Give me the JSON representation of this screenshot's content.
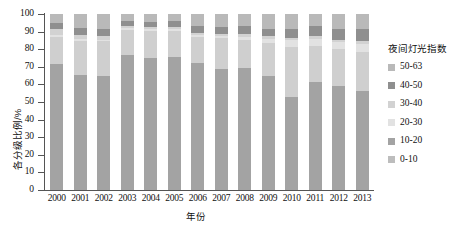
{
  "chart_data": {
    "type": "bar",
    "subtype": "stacked-percentage-bar",
    "title": "",
    "xlabel": "年份",
    "ylabel": "各分级比例/%",
    "ylim": [
      0,
      100
    ],
    "yticks": [
      0,
      10,
      20,
      30,
      40,
      50,
      60,
      70,
      80,
      90,
      100
    ],
    "grid": false,
    "legend_title": "夜间灯光指数",
    "legend_position": "right",
    "categories": [
      "2000",
      "2001",
      "2002",
      "2003",
      "2004",
      "2005",
      "2006",
      "2007",
      "2008",
      "2009",
      "2010",
      "2011",
      "2012",
      "2013"
    ],
    "series": [
      {
        "name": "0-10",
        "color": "#a3a3a3",
        "values": [
          71.5,
          65.5,
          64.5,
          76.5,
          75.0,
          75.5,
          72.0,
          69.0,
          69.5,
          65.0,
          53.0,
          61.5,
          59.0,
          56.0
        ]
      },
      {
        "name": "10-20",
        "color": "#cfcfcf",
        "values": [
          15.5,
          19.0,
          20.0,
          14.5,
          15.5,
          15.0,
          15.0,
          17.5,
          15.5,
          18.5,
          28.0,
          20.5,
          21.0,
          22.5
        ]
      },
      {
        "name": "20-30",
        "color": "#e2e2e2",
        "values": [
          1.0,
          1.5,
          1.0,
          1.0,
          1.0,
          1.0,
          1.0,
          1.0,
          2.0,
          2.5,
          4.0,
          4.0,
          4.0,
          4.5
        ]
      },
      {
        "name": "30-40",
        "color": "#d2d2d2",
        "values": [
          3.5,
          2.0,
          2.0,
          1.0,
          1.0,
          1.0,
          1.0,
          1.0,
          1.5,
          1.5,
          1.5,
          1.5,
          1.5,
          1.5
        ]
      },
      {
        "name": "40-50",
        "color": "#8f8f8f",
        "values": [
          3.5,
          4.0,
          4.0,
          3.0,
          3.0,
          3.5,
          4.0,
          4.0,
          4.5,
          4.0,
          5.0,
          5.5,
          6.0,
          7.0
        ]
      },
      {
        "name": "50-63",
        "color": "#b9b9b9",
        "values": [
          5.0,
          8.0,
          8.5,
          4.0,
          4.5,
          4.0,
          7.0,
          7.5,
          7.0,
          8.5,
          8.5,
          7.0,
          8.5,
          8.5
        ]
      }
    ],
    "legend_entries": [
      {
        "label": "50-63",
        "color": "#b9b9b9"
      },
      {
        "label": "40-50",
        "color": "#8f8f8f"
      },
      {
        "label": "30-40",
        "color": "#d2d2d2"
      },
      {
        "label": "20-30",
        "color": "#e2e2e2"
      },
      {
        "label": "10-20",
        "color": "#a3a3a3"
      },
      {
        "label": "0-10",
        "color": "#bdbdbd"
      }
    ]
  }
}
